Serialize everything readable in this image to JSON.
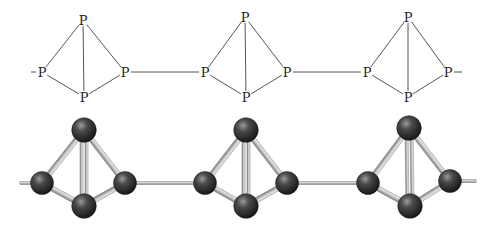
{
  "diagram": {
    "element_symbol": "P",
    "colors": {
      "bond_line": "#555555",
      "label": "#222222",
      "sphere_dark": "#1c1c1c",
      "sphere_mid": "#4a4a4a",
      "sphere_highlight": "#9a9a9a",
      "stick_light": "#e6e6e6",
      "stick_dark": "#8a8a8a"
    },
    "structural_formula": {
      "units": [
        {
          "top": [
            83,
            20
          ],
          "left": [
            42,
            72
          ],
          "right": [
            125,
            72
          ],
          "bottom": [
            84,
            97
          ]
        },
        {
          "top": [
            245,
            17
          ],
          "left": [
            205,
            72
          ],
          "right": [
            287,
            72
          ],
          "bottom": [
            246,
            97
          ]
        },
        {
          "top": [
            408,
            17
          ],
          "left": [
            367,
            72
          ],
          "right": [
            448,
            72
          ],
          "bottom": [
            408,
            97
          ]
        }
      ],
      "chain_start_x": 25,
      "chain_end_x": 468
    },
    "ball_and_stick": {
      "units": [
        {
          "top": [
            84,
            130
          ],
          "left": [
            42,
            183
          ],
          "right": [
            125,
            183
          ],
          "bottom": [
            84,
            206
          ]
        },
        {
          "top": [
            246,
            130
          ],
          "left": [
            205,
            183
          ],
          "right": [
            287,
            183
          ],
          "bottom": [
            246,
            206
          ]
        },
        {
          "top": [
            409,
            128
          ],
          "left": [
            368,
            183
          ],
          "right": [
            450,
            181
          ],
          "bottom": [
            410,
            206
          ]
        }
      ],
      "chain_start_x": 20,
      "chain_end_x": 476,
      "sphere_radius": 11.5
    }
  }
}
